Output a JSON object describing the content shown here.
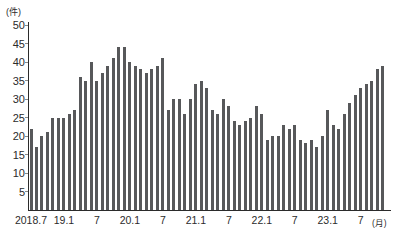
{
  "chart_data": {
    "type": "bar",
    "title": "",
    "unit_y": "(件)",
    "unit_x": "(月)",
    "ylim": [
      0,
      50
    ],
    "ytick_step": 5,
    "yticks": [
      5,
      10,
      15,
      20,
      25,
      30,
      35,
      40,
      45,
      50
    ],
    "grid": false,
    "legend": false,
    "bar_color": "#57585a",
    "axis_color": "#2b2b2b",
    "x_axis_labels": [
      "2018.7",
      "19.1",
      "7",
      "20.1",
      "7",
      "21.1",
      "7",
      "22.1",
      "7",
      "23.1",
      "7"
    ],
    "x_label_month_index": [
      0,
      6,
      12,
      18,
      24,
      30,
      36,
      42,
      48,
      54,
      60
    ],
    "categories": [
      "2018.7",
      "2018.8",
      "2018.9",
      "2018.10",
      "2018.11",
      "2018.12",
      "2019.1",
      "2019.2",
      "2019.3",
      "2019.4",
      "2019.5",
      "2019.6",
      "2019.7",
      "2019.8",
      "2019.9",
      "2019.10",
      "2019.11",
      "2019.12",
      "2020.1",
      "2020.2",
      "2020.3",
      "2020.4",
      "2020.5",
      "2020.6",
      "2020.7",
      "2020.8",
      "2020.9",
      "2020.10",
      "2020.11",
      "2020.12",
      "2021.1",
      "2021.2",
      "2021.3",
      "2021.4",
      "2021.5",
      "2021.6",
      "2021.7",
      "2021.8",
      "2021.9",
      "2021.10",
      "2021.11",
      "2021.12",
      "2022.1",
      "2022.2",
      "2022.3",
      "2022.4",
      "2022.5",
      "2022.6",
      "2022.7",
      "2022.8",
      "2022.9",
      "2022.10",
      "2022.11",
      "2022.12",
      "2023.1",
      "2023.2",
      "2023.3",
      "2023.4",
      "2023.5",
      "2023.6",
      "2023.7",
      "2023.8",
      "2023.9",
      "2023.10",
      "2023.11"
    ],
    "values": [
      22,
      17,
      20,
      21,
      25,
      25,
      25,
      26,
      27,
      36,
      35,
      40,
      35,
      37,
      39,
      41,
      44,
      44,
      40,
      39,
      38,
      37,
      38,
      39,
      41,
      27,
      30,
      30,
      26,
      30,
      34,
      35,
      33,
      27,
      26,
      30,
      28,
      24,
      23,
      24,
      25,
      28,
      26,
      19,
      20,
      20,
      23,
      22,
      23,
      19,
      18,
      19,
      17,
      20,
      27,
      23,
      22,
      26,
      29,
      31,
      33,
      34,
      35,
      38,
      39
    ]
  }
}
